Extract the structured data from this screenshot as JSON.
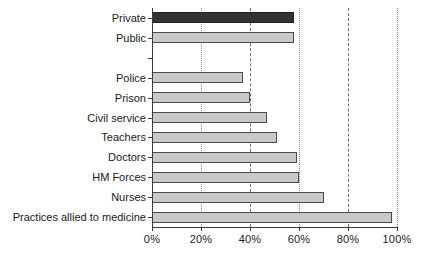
{
  "chart_data": {
    "type": "bar",
    "orientation": "horizontal",
    "title": "",
    "subtitle": "",
    "xlabel": "",
    "ylabel": "",
    "xlim": [
      0,
      100
    ],
    "xticks": [
      0,
      20,
      40,
      60,
      80,
      100
    ],
    "xticklabels": [
      "0%",
      "20%",
      "40%",
      "60%",
      "80%",
      "100%"
    ],
    "grid": "vertical-dashed",
    "legend": "none",
    "categories": [
      "Private",
      "Public",
      "",
      "Police",
      "Prison",
      "Civil service",
      "Teachers",
      "Doctors",
      "HM Forces",
      "Nurses",
      "Practices allied to medicine"
    ],
    "values": [
      58,
      58,
      null,
      37,
      40,
      47,
      51,
      59,
      60,
      70,
      98
    ],
    "bars": [
      {
        "label": "Private",
        "value": 58,
        "color": "#333333"
      },
      {
        "label": "Public",
        "value": 58,
        "color": "#c9c9c9"
      },
      {
        "label": "",
        "value": null,
        "color": "#c9c9c9"
      },
      {
        "label": "Police",
        "value": 37,
        "color": "#c9c9c9"
      },
      {
        "label": "Prison",
        "value": 40,
        "color": "#c9c9c9"
      },
      {
        "label": "Civil service",
        "value": 47,
        "color": "#c9c9c9"
      },
      {
        "label": "Teachers",
        "value": 51,
        "color": "#c9c9c9"
      },
      {
        "label": "Doctors",
        "value": 59,
        "color": "#c9c9c9"
      },
      {
        "label": "HM Forces",
        "value": 60,
        "color": "#c9c9c9"
      },
      {
        "label": "Nurses",
        "value": 70,
        "color": "#c9c9c9"
      },
      {
        "label": "Practices allied to medicine",
        "value": 98,
        "color": "#c9c9c9"
      }
    ],
    "colors": {
      "highlight_bar": "#333333",
      "default_bar": "#c9c9c9",
      "bar_outline": "#4a4a4a",
      "axis": "#3a3a3a",
      "gridline": "#6e6e6e",
      "background": "#ffffff",
      "text": "#1a1a1a"
    }
  }
}
